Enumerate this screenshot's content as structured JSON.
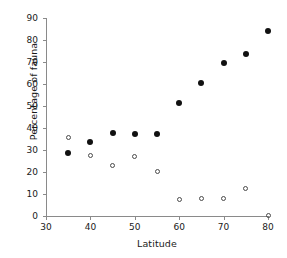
{
  "chart_data": {
    "type": "scatter",
    "title": "",
    "xlabel": "Latitude",
    "ylabel": "Percentage of fauna",
    "xlim": [
      30,
      80
    ],
    "ylim": [
      0,
      90
    ],
    "xticks": [
      30,
      40,
      50,
      60,
      70,
      80
    ],
    "yticks": [
      0,
      10,
      20,
      30,
      40,
      50,
      60,
      70,
      80,
      90
    ],
    "grid": false,
    "legend": "none",
    "series": [
      {
        "name": "filled-series",
        "marker": "filled-circle",
        "color": "#111111",
        "x": [
          35,
          40,
          45,
          50,
          55,
          60,
          65,
          70,
          75,
          80
        ],
        "y": [
          28.5,
          33.5,
          37.7,
          37.3,
          37.3,
          51.5,
          60.5,
          69.5,
          73.5,
          84.0
        ]
      },
      {
        "name": "open-series",
        "marker": "open-circle",
        "color": "#4a4a4a",
        "x": [
          35,
          40,
          45,
          50,
          55,
          60,
          65,
          70,
          75,
          80
        ],
        "y": [
          35.5,
          27.7,
          23.0,
          27.0,
          20.3,
          7.6,
          7.9,
          7.8,
          12.7,
          0.4
        ]
      }
    ]
  },
  "axes": {
    "x_tick_labels": [
      "30",
      "40",
      "50",
      "60",
      "70",
      "80"
    ],
    "y_tick_labels": [
      "0",
      "10",
      "20",
      "30",
      "40",
      "50",
      "60",
      "70",
      "80",
      "90"
    ],
    "x_axis_title": "Latitude",
    "y_axis_title": "Percentage of fauna",
    "axis_color": "#8a8a8a"
  }
}
